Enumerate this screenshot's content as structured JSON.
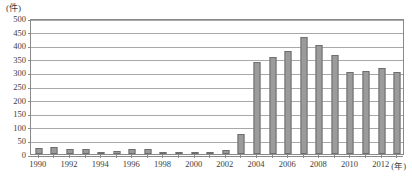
{
  "chart_data": {
    "type": "bar",
    "title": "",
    "xlabel": "(年)",
    "ylabel": "(件)",
    "ylim": [
      0,
      500
    ],
    "ytick_step": 50,
    "grid": true,
    "legend": "none",
    "bar_color": "#9b9b9b",
    "bar_border_color": "#6e6e6e",
    "categories": [
      "1990",
      "1991",
      "1992",
      "1993",
      "1994",
      "1995",
      "1996",
      "1997",
      "1998",
      "1999",
      "2000",
      "2001",
      "2002",
      "2003",
      "2004",
      "2005",
      "2006",
      "2007",
      "2008",
      "2009",
      "2010",
      "2011",
      "2012",
      "2013"
    ],
    "values": [
      22,
      24,
      17,
      18,
      8,
      10,
      17,
      20,
      4,
      9,
      9,
      8,
      15,
      72,
      337,
      358,
      377,
      430,
      402,
      363,
      303,
      305,
      315,
      300
    ],
    "ytick_labels": [
      "0",
      "50",
      "100",
      "150",
      "200",
      "250",
      "300",
      "350",
      "400",
      "450",
      "500"
    ],
    "ytick_values": [
      0,
      50,
      100,
      150,
      200,
      250,
      300,
      350,
      400,
      450,
      500
    ],
    "xtick_labels": [
      "1990",
      "1992",
      "1994",
      "1996",
      "1998",
      "2000",
      "2002",
      "2004",
      "2006",
      "2008",
      "2010",
      "2012"
    ],
    "xtick_label_categories": [
      "1990",
      "1992",
      "1994",
      "1996",
      "1998",
      "2000",
      "2002",
      "2004",
      "2006",
      "2008",
      "2010",
      "2012"
    ]
  }
}
